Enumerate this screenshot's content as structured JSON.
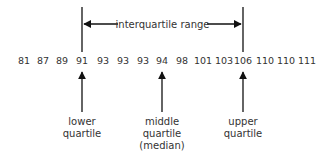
{
  "values": [
    "81",
    "87",
    "89",
    "91",
    "93",
    "93",
    "93",
    "94",
    "98",
    "101",
    "103",
    "106",
    "110",
    "110",
    "111"
  ],
  "range_label": "interquartile range",
  "markers": [
    {
      "index": 3,
      "lines": [
        "lower",
        "quartile"
      ]
    },
    {
      "index": 7,
      "lines": [
        "middle",
        "quartile",
        "(median)"
      ]
    },
    {
      "index": 11,
      "lines": [
        "upper",
        "quartile"
      ]
    }
  ],
  "colors": {
    "line": "#111111",
    "text": "#333333"
  }
}
